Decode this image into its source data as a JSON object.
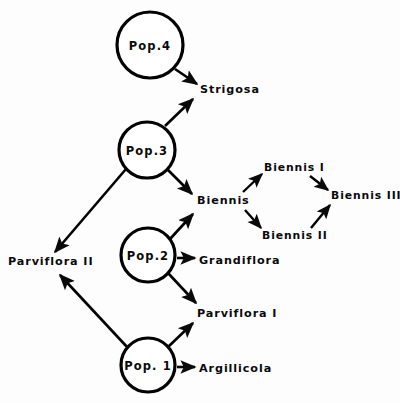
{
  "figure": {
    "background_color": "#fdfdfd",
    "ink_color": "#0a0a0a",
    "width": 400,
    "height": 403
  },
  "nodes": {
    "pop4": {
      "label": "Pop.4",
      "cx": 150,
      "cy": 45,
      "r": 33
    },
    "pop3": {
      "label": "Pop.3",
      "cx": 147,
      "cy": 150,
      "r": 28
    },
    "pop2": {
      "label": "Pop.2",
      "cx": 148,
      "cy": 255,
      "r": 27
    },
    "pop1": {
      "label": "Pop. 1",
      "cx": 148,
      "cy": 365,
      "r": 27
    }
  },
  "leaves": {
    "strigosa": {
      "label": "Strigosa",
      "x": 200,
      "y": 90
    },
    "biennis": {
      "label": "Biennis",
      "x": 197,
      "y": 201
    },
    "biennis1": {
      "label": "Biennis I",
      "x": 264,
      "y": 168
    },
    "biennis2": {
      "label": "Biennis II",
      "x": 262,
      "y": 236
    },
    "biennis3": {
      "label": "Biennis III",
      "x": 331,
      "y": 196
    },
    "grandiflora": {
      "label": "Grandiflora",
      "x": 199,
      "y": 261
    },
    "parviflora2": {
      "label": "Parviflora II",
      "x": 8,
      "y": 262
    },
    "parviflora1": {
      "label": "Parviflora I",
      "x": 197,
      "y": 314
    },
    "argillicola": {
      "label": "Argillicola",
      "x": 199,
      "y": 369
    }
  },
  "edges": [
    {
      "name": "pop4-to-strigosa",
      "from": "pop4",
      "to": "strigosa"
    },
    {
      "name": "pop3-to-strigosa",
      "from": "pop3",
      "to": "strigosa"
    },
    {
      "name": "pop3-to-biennis",
      "from": "pop3",
      "to": "biennis"
    },
    {
      "name": "pop3-to-parviflora2",
      "from": "pop3",
      "to": "parviflora2"
    },
    {
      "name": "pop2-to-grandiflora",
      "from": "pop2",
      "to": "grandiflora"
    },
    {
      "name": "pop2-to-biennis",
      "from": "pop2",
      "to": "biennis"
    },
    {
      "name": "pop2-to-parviflora1",
      "from": "pop2",
      "to": "parviflora1"
    },
    {
      "name": "pop1-to-argillicola",
      "from": "pop1",
      "to": "argillicola"
    },
    {
      "name": "pop1-to-parviflora1",
      "from": "pop1",
      "to": "parviflora1"
    },
    {
      "name": "pop1-to-parviflora2",
      "from": "pop1",
      "to": "parviflora2"
    },
    {
      "name": "biennis-to-biennis1",
      "from": "biennis",
      "to": "biennis1"
    },
    {
      "name": "biennis-to-biennis2",
      "from": "biennis",
      "to": "biennis2"
    },
    {
      "name": "biennis1-to-biennis3",
      "from": "biennis1",
      "to": "biennis3"
    },
    {
      "name": "biennis2-to-biennis3",
      "from": "biennis2",
      "to": "biennis3"
    }
  ]
}
